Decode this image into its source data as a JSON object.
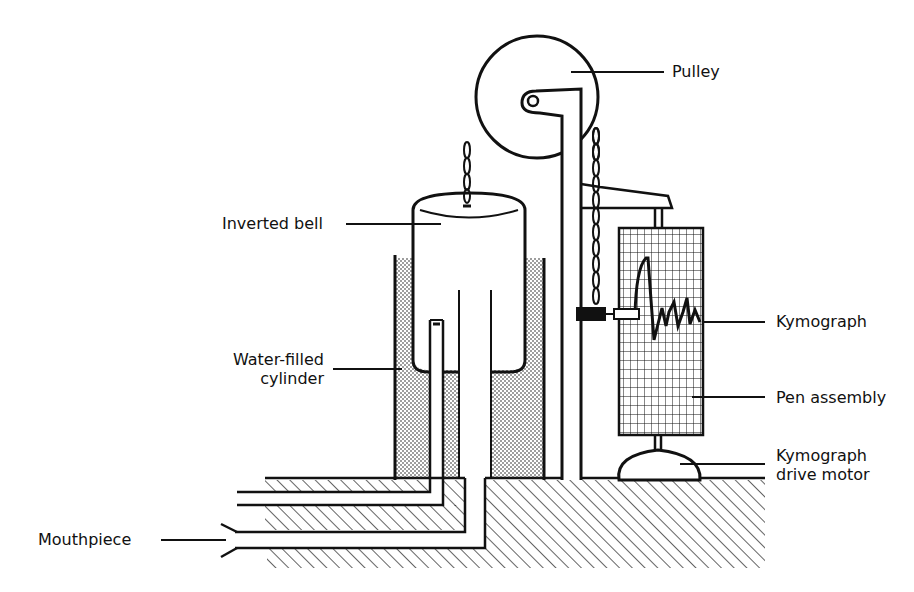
{
  "diagram": {
    "colors": {
      "ink": "#111111",
      "paper": "#ffffff"
    },
    "labels": {
      "pulley": "Pulley",
      "inverted_bell": "Inverted bell",
      "kymograph": "Kymograph",
      "water_filled_line1": "Water-filled",
      "water_filled_line2": "cylinder",
      "pen_assembly": "Pen assembly",
      "drive_motor_line1": "Kymograph",
      "drive_motor_line2": "drive motor",
      "mouthpiece": "Mouthpiece"
    },
    "components": [
      "pulley",
      "chain",
      "inverted-bell",
      "water-filled-cylinder",
      "support-post",
      "counterweight",
      "pen-assembly",
      "kymograph-drum",
      "kymograph-drive-motor",
      "air-tubes",
      "mouthpiece",
      "base"
    ]
  }
}
